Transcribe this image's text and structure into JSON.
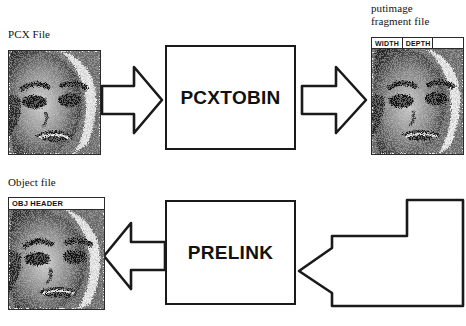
{
  "diagram": {
    "stroke_color": "#1a1a1a",
    "background_color": "#ffffff",
    "labels": {
      "pcx_file": "PCX File",
      "object_file": "Object file",
      "fragment_file": "putimage\nfragment file"
    },
    "process_boxes": [
      {
        "id": "pcxtobin",
        "label": "PCXTOBIN"
      },
      {
        "id": "prelink",
        "label": "PRELINK"
      }
    ],
    "thumbnails": {
      "pcx": {
        "name": "pcx-file-thumbnail",
        "header_cells": []
      },
      "fragment": {
        "name": "fragment-file-thumbnail",
        "header_cells": [
          "WIDTH",
          "DEPTH",
          ""
        ]
      },
      "object": {
        "name": "object-file-thumbnail",
        "header_cells": [
          "OBJ HEADER"
        ]
      }
    },
    "arrows": [
      {
        "id": "pcx-to-pcxtobin",
        "direction": "right",
        "style": "block-arrow"
      },
      {
        "id": "pcxtobin-to-fragment",
        "direction": "right",
        "style": "block-arrow"
      },
      {
        "id": "fragment-to-prelink",
        "direction": "left",
        "style": "bent-block-arrow"
      },
      {
        "id": "prelink-to-object",
        "direction": "left",
        "style": "block-arrow"
      }
    ]
  }
}
